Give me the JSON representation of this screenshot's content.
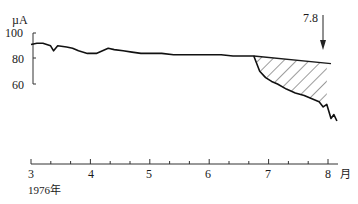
{
  "chart_data": {
    "type": "line",
    "title": "",
    "ylabel": "µA",
    "xlabel": "月",
    "year_label": "1976年",
    "ylim": [
      60,
      100
    ],
    "yticks": [
      100,
      80,
      60
    ],
    "xticks": [
      "3",
      "4",
      "5",
      "6",
      "7",
      "8"
    ],
    "x_unit": "月",
    "annotation": {
      "text": "7.8",
      "x": 7.9,
      "type": "arrow-down"
    },
    "hatched_region": {
      "from": 6.75,
      "to": 7.98,
      "description": "area between extrapolated trend line and observed values"
    },
    "trend_line": {
      "x": [
        6.75,
        8.05
      ],
      "y": [
        82,
        76
      ]
    },
    "series": [
      {
        "name": "observed",
        "x": [
          3.0,
          3.1,
          3.2,
          3.33,
          3.38,
          3.45,
          3.6,
          3.7,
          3.8,
          3.95,
          4.1,
          4.3,
          4.4,
          4.55,
          4.7,
          4.85,
          5.0,
          5.2,
          5.4,
          5.6,
          5.8,
          6.0,
          6.2,
          6.4,
          6.6,
          6.75,
          6.85,
          6.95,
          7.05,
          7.15,
          7.3,
          7.45,
          7.6,
          7.75,
          7.85,
          7.92,
          7.98,
          8.05,
          8.1,
          8.15
        ],
        "y": [
          91,
          92,
          92,
          90,
          86,
          90,
          89,
          88,
          86,
          84,
          84,
          88,
          87,
          86,
          85,
          84,
          84,
          84,
          83,
          83,
          83,
          83,
          83,
          82,
          82,
          82,
          70,
          65,
          62,
          60,
          56,
          53,
          51,
          48,
          46,
          42,
          44,
          33,
          36,
          31
        ]
      }
    ]
  }
}
